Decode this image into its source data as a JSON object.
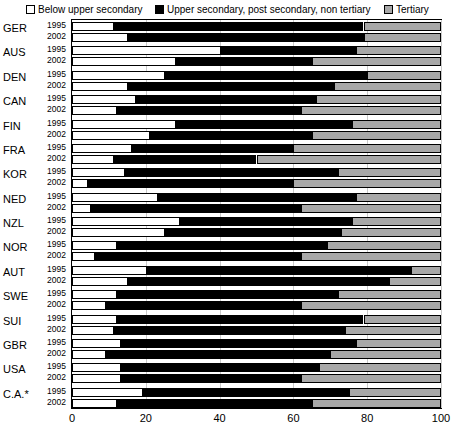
{
  "legend": {
    "items": [
      {
        "id": "below",
        "label": "Below upper secondary",
        "color": "#ffffff"
      },
      {
        "id": "upper",
        "label": "Upper secondary, post secondary, non tertiary",
        "color": "#000000"
      },
      {
        "id": "tertiary",
        "label": "Tertiary",
        "color": "#a8a8a8"
      }
    ]
  },
  "axis": {
    "ticks": [
      "0",
      "20",
      "40",
      "60",
      "80",
      "100"
    ],
    "tick_values": [
      0,
      20,
      40,
      60,
      80,
      100
    ],
    "xlim": [
      0,
      100
    ]
  },
  "chart_data": {
    "type": "bar",
    "orientation": "horizontal",
    "stacked": true,
    "title": "",
    "xlabel": "",
    "ylabel": "",
    "xlim": [
      0,
      100
    ],
    "grid": true,
    "legend_position": "top",
    "series": [
      {
        "name": "Below upper secondary",
        "color": "#ffffff"
      },
      {
        "name": "Upper secondary, post secondary, non tertiary",
        "color": "#000000"
      },
      {
        "name": "Tertiary",
        "color": "#a8a8a8"
      }
    ],
    "groups": [
      {
        "category": "GER",
        "rows": [
          {
            "year": "1995",
            "values": [
              11,
              68,
              21
            ]
          },
          {
            "year": "2002",
            "values": [
              15,
              64,
              21
            ]
          }
        ]
      },
      {
        "category": "AUS",
        "rows": [
          {
            "year": "1995",
            "values": [
              40,
              37,
              23
            ]
          },
          {
            "year": "2002",
            "values": [
              28,
              37,
              35
            ]
          }
        ]
      },
      {
        "category": "DEN",
        "rows": [
          {
            "year": "1995",
            "values": [
              25,
              55,
              20
            ]
          },
          {
            "year": "2002",
            "values": [
              15,
              56,
              29
            ]
          }
        ]
      },
      {
        "category": "CAN",
        "rows": [
          {
            "year": "1995",
            "values": [
              17,
              49,
              34
            ]
          },
          {
            "year": "2002",
            "values": [
              12,
              50,
              38
            ]
          }
        ]
      },
      {
        "category": "FIN",
        "rows": [
          {
            "year": "1995",
            "values": [
              28,
              48,
              24
            ]
          },
          {
            "year": "2002",
            "values": [
              21,
              44,
              35
            ]
          }
        ]
      },
      {
        "category": "FRA",
        "rows": [
          {
            "year": "1995",
            "values": [
              16,
              44,
              40
            ]
          },
          {
            "year": "2002",
            "values": [
              11,
              39,
              50
            ]
          }
        ]
      },
      {
        "category": "KOR",
        "rows": [
          {
            "year": "1995",
            "values": [
              14,
              58,
              28
            ]
          },
          {
            "year": "2002",
            "values": [
              4,
              56,
              40
            ]
          }
        ]
      },
      {
        "category": "NED",
        "rows": [
          {
            "year": "1995",
            "values": [
              23,
              54,
              23
            ]
          },
          {
            "year": "2002",
            "values": [
              5,
              57,
              38
            ]
          }
        ]
      },
      {
        "category": "NZL",
        "rows": [
          {
            "year": "1995",
            "values": [
              29,
              47,
              24
            ]
          },
          {
            "year": "2002",
            "values": [
              25,
              48,
              27
            ]
          }
        ]
      },
      {
        "category": "NOR",
        "rows": [
          {
            "year": "1995",
            "values": [
              12,
              57,
              31
            ]
          },
          {
            "year": "2002",
            "values": [
              6,
              56,
              38
            ]
          }
        ]
      },
      {
        "category": "AUT",
        "rows": [
          {
            "year": "1995",
            "values": [
              20,
              72,
              8
            ]
          },
          {
            "year": "2002",
            "values": [
              15,
              71,
              14
            ]
          }
        ]
      },
      {
        "category": "SWE",
        "rows": [
          {
            "year": "1995",
            "values": [
              12,
              60,
              28
            ]
          },
          {
            "year": "2002",
            "values": [
              9,
              53,
              38
            ]
          }
        ]
      },
      {
        "category": "SUI",
        "rows": [
          {
            "year": "1995",
            "values": [
              12,
              67,
              21
            ]
          },
          {
            "year": "2002",
            "values": [
              11,
              63,
              26
            ]
          }
        ]
      },
      {
        "category": "GBR",
        "rows": [
          {
            "year": "1995",
            "values": [
              13,
              64,
              23
            ]
          },
          {
            "year": "2002",
            "values": [
              9,
              61,
              30
            ]
          }
        ]
      },
      {
        "category": "USA",
        "rows": [
          {
            "year": "1995",
            "values": [
              13,
              54,
              33
            ]
          },
          {
            "year": "2002",
            "values": [
              13,
              49,
              38
            ]
          }
        ]
      },
      {
        "category": "C.A.*",
        "rows": [
          {
            "year": "1995",
            "values": [
              19,
              56,
              25
            ]
          },
          {
            "year": "2002",
            "values": [
              12,
              53,
              35
            ]
          }
        ]
      }
    ]
  }
}
